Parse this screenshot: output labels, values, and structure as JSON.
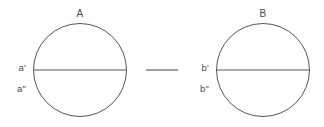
{
  "figure": {
    "background_color": "#ffffff",
    "stroke_color": "#555555",
    "text_color": "#4a4a4a",
    "groups": [
      {
        "id": "A",
        "top_label": "A",
        "top_label_x": 80,
        "top_label_y": 14,
        "circle": {
          "cx": 80,
          "cy": 70,
          "r": 46.5
        },
        "diameter": {
          "x1": 33.5,
          "y1": 70,
          "x2": 126.5,
          "y2": 70
        },
        "side_labels": [
          {
            "text": "a'",
            "x": 26,
            "y": 68
          },
          {
            "text": "a\"",
            "x": 26,
            "y": 89
          }
        ]
      },
      {
        "id": "B",
        "top_label": "B",
        "top_label_x": 263,
        "top_label_y": 14,
        "circle": {
          "cx": 263,
          "cy": 70,
          "r": 46.5
        },
        "diameter": {
          "x1": 216.5,
          "y1": 70,
          "x2": 309.5,
          "y2": 70
        },
        "side_labels": [
          {
            "text": "b'",
            "x": 209,
            "y": 68
          },
          {
            "text": "b\"",
            "x": 209,
            "y": 89
          }
        ]
      }
    ],
    "separator": {
      "x1": 146,
      "y1": 70,
      "x2": 178,
      "y2": 70
    }
  }
}
